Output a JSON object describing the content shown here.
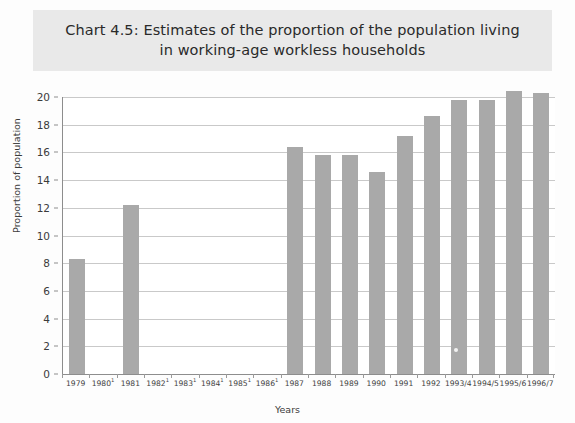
{
  "chart_data": {
    "type": "bar",
    "title": "Chart 4.5: Estimates of the proportion of the population living\nin working-age workless households",
    "xlabel": "Years",
    "ylabel": "Proportion of population",
    "ylim": [
      0,
      20
    ],
    "ytick_step": 2,
    "yticks": [
      "20",
      "18",
      "16",
      "14",
      "12",
      "10",
      "8",
      "6",
      "4",
      "2",
      "0"
    ],
    "grid": true,
    "legend": "none",
    "bar_color": "#a9a9a9",
    "categories": [
      "1979",
      "1980",
      "1981",
      "1982",
      "1983",
      "1984",
      "1985",
      "1986",
      "1987",
      "1988",
      "1989",
      "1990",
      "1991",
      "1992",
      "1993/4",
      "1994/5",
      "1995/6",
      "1996/7"
    ],
    "category_footnotes": [
      "",
      "1",
      "",
      "1",
      "1",
      "1",
      "1",
      "1",
      "",
      "",
      "",
      "",
      "",
      "",
      "",
      "",
      "",
      ""
    ],
    "values": [
      8.3,
      null,
      12.2,
      null,
      null,
      null,
      null,
      null,
      16.4,
      15.8,
      15.8,
      14.6,
      17.2,
      18.6,
      19.8,
      19.8,
      20.4,
      20.3
    ]
  }
}
